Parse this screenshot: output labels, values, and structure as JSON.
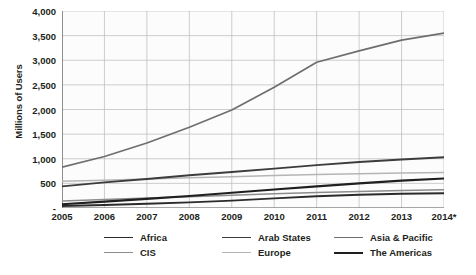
{
  "chart_data": {
    "type": "line",
    "title": "",
    "xlabel": "",
    "ylabel": "Millions of Users",
    "x": [
      "2005",
      "2006",
      "2007",
      "2008",
      "2009",
      "2010",
      "2011",
      "2012",
      "2013",
      "2014*"
    ],
    "ylim": [
      0,
      4000
    ],
    "yticks": [
      {
        "value": 4000,
        "label": "4,000"
      },
      {
        "value": 3500,
        "label": "3,500"
      },
      {
        "value": 3000,
        "label": "3,000"
      },
      {
        "value": 2500,
        "label": "2,500"
      },
      {
        "value": 2000,
        "label": "2,000"
      },
      {
        "value": 1500,
        "label": "1,500"
      },
      {
        "value": 1000,
        "label": "1,000"
      },
      {
        "value": 500,
        "label": "500"
      },
      {
        "value": 0,
        "label": "-"
      }
    ],
    "grid": true,
    "legend_position": "bottom",
    "series": [
      {
        "name": "Africa",
        "color": "#2b2b2b",
        "width": 1.9,
        "values": [
          40,
          60,
          85,
          115,
          150,
          195,
          240,
          270,
          290,
          300
        ]
      },
      {
        "name": "Arab States",
        "color": "#3c3c3c",
        "width": 1.9,
        "values": [
          440,
          520,
          590,
          665,
          730,
          800,
          870,
          935,
          985,
          1030
        ]
      },
      {
        "name": "Asia & Pacific",
        "color": "#6e6e6e",
        "width": 1.7,
        "values": [
          830,
          1045,
          1320,
          1640,
          1990,
          2450,
          2960,
          3190,
          3410,
          3550
        ]
      },
      {
        "name": "CIS",
        "color": "#8c8c8c",
        "width": 1.5,
        "values": [
          140,
          175,
          205,
          230,
          260,
          290,
          315,
          335,
          355,
          370
        ]
      },
      {
        "name": "Europe",
        "color": "#b5b5b5",
        "width": 1.5,
        "values": [
          545,
          565,
          590,
          615,
          635,
          660,
          680,
          695,
          710,
          720
        ]
      },
      {
        "name": "The Americas",
        "color": "#1f1f1f",
        "width": 2.1,
        "values": [
          75,
          130,
          185,
          245,
          310,
          375,
          440,
          500,
          555,
          600
        ]
      }
    ]
  }
}
